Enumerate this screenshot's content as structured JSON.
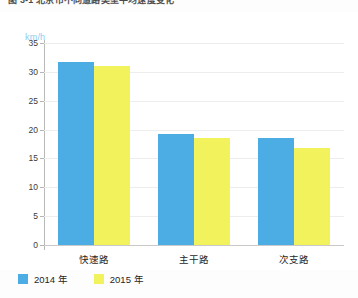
{
  "caption": {
    "text": "图 3-1  北京市不同道路类型平均速度变化"
  },
  "chart_data": {
    "type": "bar",
    "title": "",
    "subtitle": "",
    "xlabel": "",
    "ylabel": "km/h",
    "unit_label": "km/h",
    "categories": [
      "快速路",
      "主干路",
      "次支路"
    ],
    "series": [
      {
        "name": "2014 年",
        "color": "#4badE3",
        "values": [
          31.7,
          19.2,
          18.5
        ]
      },
      {
        "name": "2015 年",
        "color": "#F2F25C",
        "values": [
          31.0,
          18.5,
          16.8
        ]
      }
    ],
    "ylim": [
      0,
      35
    ],
    "ytick_step": 5,
    "ytick_labels": [
      "35",
      "30",
      "25",
      "20",
      "15",
      "10",
      "5",
      "0"
    ],
    "grid": true,
    "legend_position": "bottom-left"
  },
  "legend": {
    "items": [
      {
        "label": "2014 年",
        "color": "#4badE3"
      },
      {
        "label": "2015 年",
        "color": "#F2F25C"
      }
    ]
  },
  "colors": {
    "series_2014": "#4badE3",
    "series_2015": "#F2F25C",
    "unit_label": "#8ecdf0",
    "grid": "#ededed",
    "axis": "#b9b9b9",
    "background": "#ffffff"
  }
}
